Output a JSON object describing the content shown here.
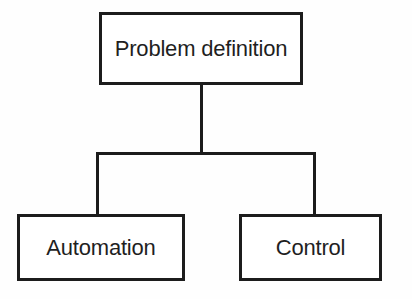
{
  "diagram": {
    "type": "hierarchy-tree",
    "background_color": "#fefefe",
    "stroke_color": "#1c1c1c",
    "text_color": "#1f1f1f",
    "nodes": [
      {
        "id": "root",
        "label": "Problem definition",
        "level": 0
      },
      {
        "id": "automation",
        "label": "Automation",
        "level": 1
      },
      {
        "id": "control",
        "label": "Control",
        "level": 1
      }
    ],
    "edges": [
      {
        "from": "root",
        "to": "automation"
      },
      {
        "from": "root",
        "to": "control"
      }
    ]
  }
}
